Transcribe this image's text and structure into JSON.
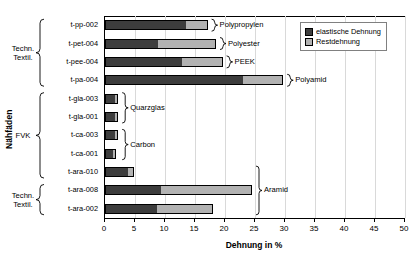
{
  "chart_data": {
    "type": "bar",
    "orientation": "horizontal",
    "stacked": true,
    "title": "",
    "xlabel": "Dehnung in %",
    "ylabel": "Nähfäden",
    "xlim": [
      0,
      50
    ],
    "xticks": [
      "0",
      "5",
      "10",
      "15",
      "20",
      "25",
      "30",
      "35",
      "40",
      "45",
      "50"
    ],
    "grid": true,
    "legend_position": "top-right",
    "categories": [
      "t-pp-002",
      "t-pet-004",
      "t-pee-004",
      "t-pa-004",
      "t-gla-003",
      "t-gla-001",
      "t-ca-003",
      "t-ca-001",
      "t-ara-010",
      "t-ara-008",
      "t-ara-002"
    ],
    "series": [
      {
        "name": "elastische Dehnung",
        "color": "#3d3d3d",
        "values": [
          13.6,
          8.9,
          12.9,
          23.1,
          1.7,
          1.7,
          1.7,
          1.5,
          3.9,
          9.3,
          8.6
        ]
      },
      {
        "name": "Restdehnung",
        "color": "#b2b2b2",
        "values": [
          3.5,
          9.6,
          6.7,
          6.6,
          0.4,
          0.5,
          0.5,
          0.4,
          0.9,
          15.2,
          9.4
        ]
      }
    ],
    "totals": [
      17.1,
      18.5,
      19.6,
      29.7,
      2.1,
      2.2,
      2.2,
      1.9,
      4.8,
      24.5,
      18.0
    ],
    "axis_groups": [
      {
        "label": "Techn.\nTextil.",
        "categories": [
          "t-pp-002",
          "t-pet-004",
          "t-pee-004",
          "t-pa-004"
        ]
      },
      {
        "label": "FVK",
        "categories": [
          "t-gla-003",
          "t-gla-001",
          "t-ca-003",
          "t-ca-001",
          "t-ara-010"
        ]
      },
      {
        "label": "Techn.\nTextil.",
        "categories": [
          "t-ara-008",
          "t-ara-002"
        ]
      }
    ],
    "material_annotations": [
      {
        "label": "Polypropylen",
        "categories": [
          "t-pp-002"
        ]
      },
      {
        "label": "Polyester",
        "categories": [
          "t-pet-004"
        ]
      },
      {
        "label": "PEEK",
        "categories": [
          "t-pee-004"
        ]
      },
      {
        "label": "Polyamid",
        "categories": [
          "t-pa-004"
        ]
      },
      {
        "label": "Quarzglas",
        "categories": [
          "t-gla-003",
          "t-gla-001"
        ]
      },
      {
        "label": "Carbon",
        "categories": [
          "t-ca-003",
          "t-ca-001"
        ]
      },
      {
        "label": "Aramid",
        "categories": [
          "t-ara-010",
          "t-ara-008",
          "t-ara-002"
        ]
      }
    ]
  }
}
